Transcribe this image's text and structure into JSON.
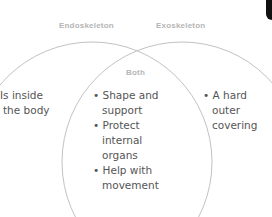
{
  "diagram": {
    "type": "venn",
    "left_set": {
      "label": "Endoskeleton",
      "items": [
        "Is inside",
        "the body"
      ]
    },
    "right_set": {
      "label": "Exoskeleton",
      "items": [
        "• A hard",
        "outer",
        "covering"
      ]
    },
    "intersection": {
      "label": "Both",
      "items": [
        "• Shape and",
        "support",
        "• Protect",
        "internal",
        "organs",
        "• Help with",
        "movement"
      ]
    },
    "colors": {
      "circle_stroke": "#bdbdbd",
      "header_text": "#b5b5b5",
      "body_text": "#555555"
    }
  }
}
